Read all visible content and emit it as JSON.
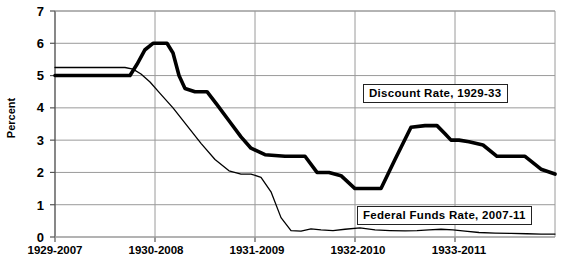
{
  "chart_data": {
    "type": "line",
    "title": "",
    "xlabel": "",
    "ylabel": "Percent",
    "ylim": [
      0,
      7
    ],
    "yticks": [
      0,
      1,
      2,
      3,
      4,
      5,
      6,
      7
    ],
    "xticks": [
      "1929-2007",
      "1930-2008",
      "1931-2009",
      "1932-2010",
      "1933-2011"
    ],
    "grid": true,
    "legend_position": "inline-annotations",
    "series": [
      {
        "name": "Discount Rate, 1929-33",
        "style": "thick-black",
        "color": "#000000",
        "x": [
          0.0,
          0.5,
          0.75,
          0.82,
          0.9,
          0.98,
          1.05,
          1.12,
          1.18,
          1.24,
          1.3,
          1.4,
          1.52,
          1.62,
          1.74,
          1.86,
          1.96,
          2.1,
          2.3,
          2.5,
          2.62,
          2.74,
          2.86,
          3.0,
          3.06,
          3.14,
          3.26,
          3.4,
          3.56,
          3.7,
          3.82,
          3.9,
          3.96,
          4.04,
          4.14,
          4.28,
          4.42,
          4.56,
          4.7,
          4.86,
          5.0
        ],
        "y": [
          5.0,
          5.0,
          5.0,
          5.35,
          5.8,
          6.0,
          6.0,
          6.0,
          5.7,
          5.0,
          4.6,
          4.5,
          4.5,
          4.1,
          3.6,
          3.1,
          2.75,
          2.55,
          2.5,
          2.5,
          2.0,
          2.0,
          1.9,
          1.5,
          1.5,
          1.5,
          1.5,
          2.4,
          3.4,
          3.45,
          3.45,
          3.2,
          3.0,
          3.0,
          2.95,
          2.85,
          2.5,
          2.5,
          2.5,
          2.1,
          1.95
        ]
      },
      {
        "name": "Federal Funds Rate, 2007-11",
        "style": "thin-black",
        "color": "#000000",
        "x": [
          0.0,
          0.4,
          0.7,
          0.78,
          0.86,
          0.95,
          1.05,
          1.18,
          1.32,
          1.46,
          1.6,
          1.74,
          1.86,
          1.96,
          2.06,
          2.16,
          2.26,
          2.36,
          2.46,
          2.56,
          2.66,
          2.78,
          2.9,
          3.05,
          3.2,
          3.35,
          3.5,
          3.62,
          3.74,
          3.86,
          3.98,
          4.1,
          4.24,
          4.4,
          4.56,
          4.72,
          4.86,
          5.0
        ],
        "y": [
          5.25,
          5.25,
          5.25,
          5.2,
          5.05,
          4.8,
          4.45,
          4.0,
          3.45,
          2.9,
          2.4,
          2.05,
          1.95,
          1.95,
          1.85,
          1.4,
          0.6,
          0.2,
          0.18,
          0.25,
          0.22,
          0.2,
          0.24,
          0.28,
          0.22,
          0.2,
          0.19,
          0.2,
          0.22,
          0.24,
          0.22,
          0.18,
          0.14,
          0.12,
          0.11,
          0.1,
          0.09,
          0.09
        ]
      }
    ],
    "annotations": [
      {
        "text": "Discount Rate, 1929-33",
        "x_px": 363,
        "y_px": 84
      },
      {
        "text": "Federal Funds Rate, 2007-11",
        "x_px": 357,
        "y_px": 206
      }
    ],
    "axis_colors": {
      "gridline": "#9a9a9a",
      "axis": "#555555",
      "series": "#000000"
    }
  }
}
